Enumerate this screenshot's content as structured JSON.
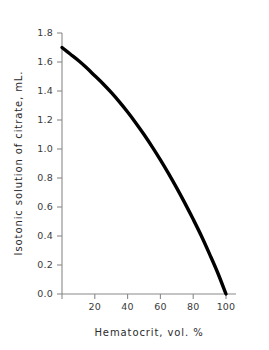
{
  "chart_data": {
    "type": "line",
    "title": "",
    "subtitle": "",
    "xlabel": "Hematocrit, vol. %",
    "ylabel": "Isotonic solution of citrate, mL.",
    "xlim": [
      0,
      104
    ],
    "ylim": [
      0.0,
      1.8
    ],
    "grid": false,
    "legend": null,
    "legend_position": "none",
    "line_color": "#000000",
    "axis_color": "#8a8a8a",
    "background_color": "#ffffff",
    "xticks": [
      20,
      40,
      60,
      80,
      100
    ],
    "xtick_labels": [
      "20",
      "40",
      "60",
      "80",
      "100"
    ],
    "yticks": [
      0.0,
      0.2,
      0.4,
      0.6,
      0.8,
      1.0,
      1.2,
      1.4,
      1.6,
      1.8
    ],
    "ytick_labels": [
      "0.0",
      "0.2",
      "0.4",
      "0.6",
      "0.8",
      "1.0",
      "1.2",
      "1.4",
      "1.6",
      "1.8"
    ],
    "series": [
      {
        "name": "citrate requirement",
        "x": [
          0,
          5,
          10,
          15,
          20,
          25,
          30,
          35,
          40,
          45,
          50,
          55,
          60,
          65,
          70,
          75,
          80,
          85,
          90,
          95,
          100
        ],
        "y": [
          1.7,
          1.655,
          1.61,
          1.56,
          1.505,
          1.45,
          1.39,
          1.325,
          1.255,
          1.18,
          1.1,
          1.015,
          0.925,
          0.83,
          0.73,
          0.625,
          0.515,
          0.4,
          0.275,
          0.145,
          0.0
        ]
      }
    ],
    "annotations": []
  },
  "axis_titles": {
    "x": "Hematocrit, vol. %",
    "y": "Isotonic solution of citrate, mL."
  }
}
